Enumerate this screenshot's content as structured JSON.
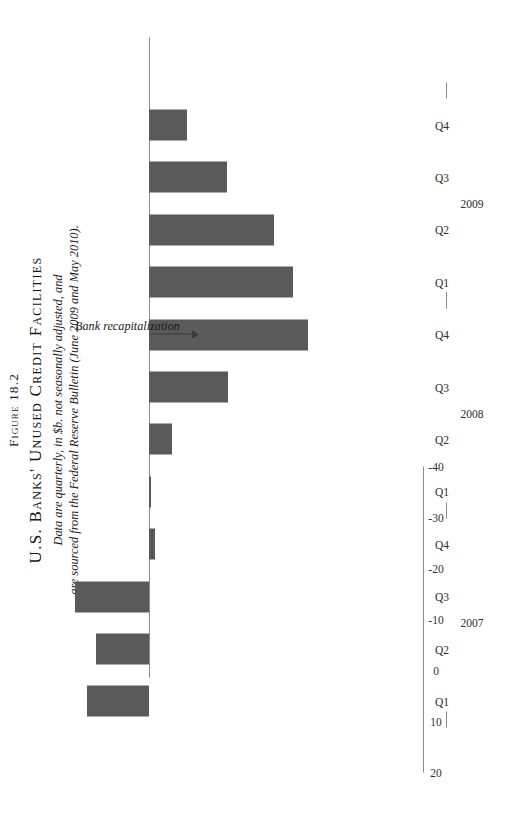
{
  "figure": {
    "number": "Figure 18.2",
    "title": "U.S. Banks' Unused Credit Facilities",
    "caption_line1": "Data are quarterly, in $b. not seasonally adjusted, and",
    "caption_line2": "are sourced from the Federal Reserve Bulletin (June 2009 and May 2010)."
  },
  "annotation": {
    "label": "Bank recapitalization",
    "target_category": "Q4 2008"
  },
  "colors": {
    "bar": "#5a5a5a",
    "axis": "#8a8a8a",
    "text": "#1b1b1b",
    "background": "#ffffff"
  },
  "chart_data": {
    "type": "bar",
    "title": "U.S. Banks' Unused Credit Facilities",
    "xlabel": "",
    "ylabel": "",
    "orientation": "vertical",
    "grid": false,
    "legend": "none",
    "ylim": [
      -40,
      20
    ],
    "yticks": [
      20,
      10,
      0,
      -10,
      -20,
      -30,
      -40
    ],
    "ytick_labels": [
      "20",
      "10",
      "0",
      "-10",
      "-20",
      "-30",
      "-40"
    ],
    "categories": [
      "Q1",
      "Q2",
      "Q3",
      "Q4",
      "Q1",
      "Q2",
      "Q3",
      "Q4",
      "Q1",
      "Q2",
      "Q3",
      "Q4"
    ],
    "year_groups": [
      {
        "label": "2007",
        "start": 0,
        "end": 3
      },
      {
        "label": "2008",
        "start": 4,
        "end": 7
      },
      {
        "label": "2009",
        "start": 8,
        "end": 11
      }
    ],
    "values": [
      12.2,
      10.3,
      14.5,
      -1.1,
      -0.4,
      -4.6,
      -15.5,
      -31.2,
      -28.3,
      -24.5,
      -15.3,
      -7.5
    ],
    "units": "$b"
  }
}
